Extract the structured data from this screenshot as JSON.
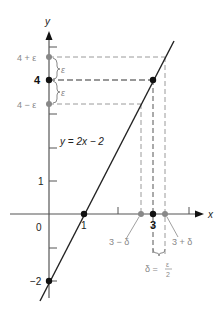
{
  "diagram": {
    "axes": {
      "x_label": "x",
      "y_label": "y",
      "origin_label": "0"
    },
    "equation_label": "y = 2x − 2",
    "y_labels": {
      "four_plus_eps": "4 + ε",
      "four": "4",
      "four_minus_eps": "4 − ε",
      "one": "1",
      "minus_two": "−2"
    },
    "x_labels": {
      "one": "1",
      "three": "3",
      "three_minus_delta": "3 − δ",
      "three_plus_delta": "3 + δ"
    },
    "brace_labels": {
      "eps_upper": "ε",
      "eps_lower": "ε",
      "delta_eq": "δ = ",
      "eps_num": "ε",
      "two_den": "2"
    },
    "colors": {
      "line": "#222222",
      "dashed": "#999999",
      "dashed_dark": "#333333",
      "gray_point": "#888888",
      "black_point": "#111111"
    }
  }
}
